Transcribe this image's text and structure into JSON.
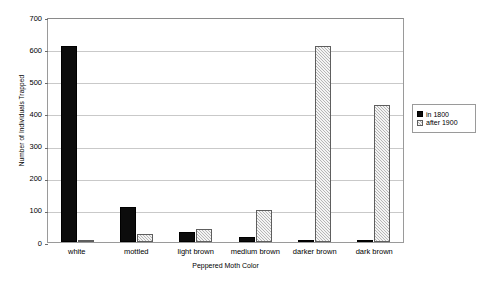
{
  "chart_data": {
    "type": "bar",
    "title": "",
    "xlabel": "Peppered Moth Color",
    "ylabel": "Number of Individuals Trapped",
    "categories": [
      "white",
      "mottled",
      "light brown",
      "medium brown",
      "darker brown",
      "dark brown"
    ],
    "series": [
      {
        "name": "in 1800",
        "color": "#0c0c0c",
        "values": [
          610,
          110,
          30,
          15,
          5,
          3
        ]
      },
      {
        "name": "after 1900",
        "color": "#b6b6b6",
        "values": [
          5,
          25,
          40,
          100,
          610,
          425
        ]
      }
    ],
    "ylim": [
      0,
      700
    ],
    "yticks": [
      0,
      100,
      200,
      300,
      400,
      500,
      600,
      700
    ],
    "ytick_labels": [
      "0",
      "100",
      "200",
      "300",
      "400",
      "500",
      "600",
      "700"
    ],
    "grid": true,
    "legend_position": "right",
    "legend_entries": [
      "in 1800",
      "after 1900"
    ]
  },
  "colors": {
    "series_a": "#0c0c0c",
    "series_b": "#b6b6b6",
    "gridline": "#c9c9c9",
    "axis": "#9a9a9a",
    "background": "#ffffff"
  }
}
